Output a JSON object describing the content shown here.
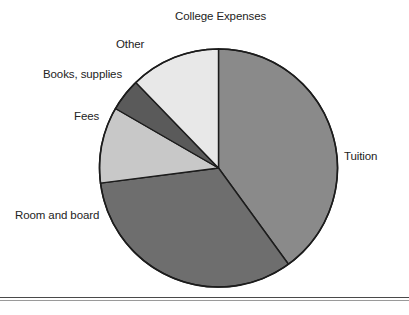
{
  "chart_data": {
    "type": "pie",
    "title": "College Expenses",
    "xlabel": "",
    "ylabel": "",
    "legend_position": "none",
    "grid": false,
    "labels_outside": true,
    "categories": [
      "Tuition",
      "Room and board",
      "Fees",
      "Books, supplies",
      "Other"
    ],
    "values": [
      40,
      33,
      10,
      4.5,
      12.5
    ],
    "start_angle_deg": 0,
    "direction": "clockwise",
    "slices": [
      {
        "label": "Tuition",
        "value": 40,
        "color": "#8a8a8a",
        "start_deg": 0,
        "end_deg": 144
      },
      {
        "label": "Room and board",
        "value": 33,
        "color": "#6e6e6e",
        "start_deg": 144,
        "end_deg": 262.7
      },
      {
        "label": "Fees",
        "value": 10,
        "color": "#c8c8c8",
        "start_deg": 262.7,
        "end_deg": 300
      },
      {
        "label": "Books, supplies",
        "value": 4.5,
        "color": "#5a5a5a",
        "start_deg": 300,
        "end_deg": 316
      },
      {
        "label": "Other",
        "value": 12.5,
        "color": "#e8e8e8",
        "start_deg": 316,
        "end_deg": 360
      }
    ]
  },
  "chart": {
    "title": "College Expenses",
    "labels": {
      "tuition": "Tuition",
      "room_and_board": "Room and board",
      "fees": "Fees",
      "books_supplies": "Books, supplies",
      "other": "Other"
    },
    "colors": {
      "tuition": "#8a8a8a",
      "room_and_board": "#6e6e6e",
      "fees": "#c8c8c8",
      "books_supplies": "#5a5a5a",
      "other": "#e8e8e8",
      "outline": "#1c1c1c",
      "rule": "#4a4a4a"
    },
    "geometry": {
      "cx": 218.5,
      "cy": 168,
      "r": 119
    }
  }
}
